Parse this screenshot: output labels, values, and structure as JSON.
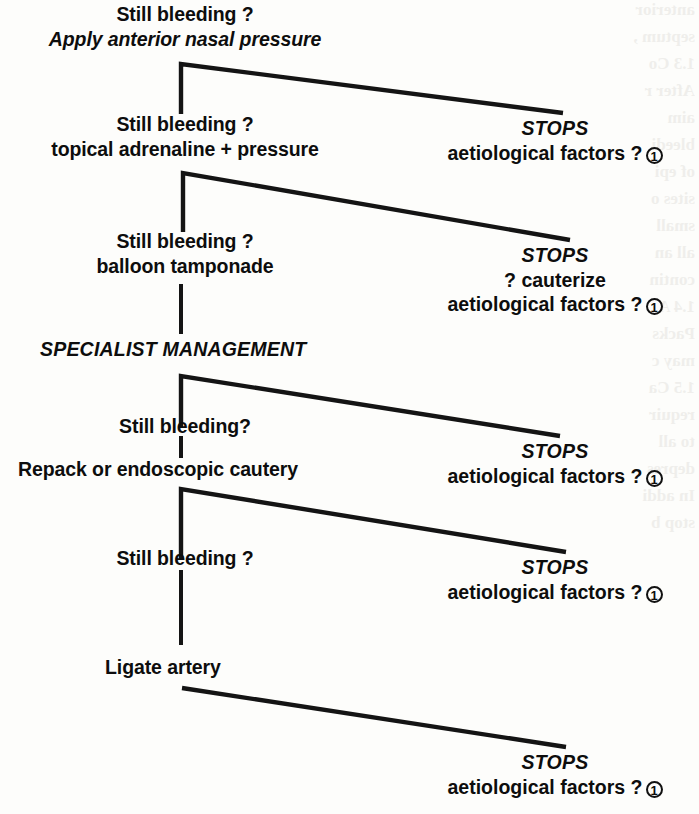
{
  "figure": {
    "type": "clinical-management-flowchart",
    "orientation": "vertical-cascade",
    "ink_color": "#141414",
    "page_color": "#fdfdfb"
  },
  "steps": [
    {
      "id": "step-1",
      "line1": "Still bleeding ?",
      "line2": "Apply anterior nasal pressure",
      "line2_style": "italic"
    },
    {
      "id": "step-2",
      "line1": "Still bleeding ?",
      "line2": "topical adrenaline + pressure",
      "line2_style": "normal"
    },
    {
      "id": "step-3",
      "line1": "Still bleeding  ?",
      "line2": "balloon tamponade",
      "line2_style": "normal"
    },
    {
      "id": "step-4",
      "line1": "Still bleeding?",
      "line2": "Repack or endoscopic cautery",
      "line2_style": "normal"
    },
    {
      "id": "step-5",
      "line1": "Still bleeding ?",
      "line2": "",
      "line2_style": "normal"
    },
    {
      "id": "step-6",
      "line1": "Ligate artery",
      "line2": "",
      "line2_style": "normal"
    }
  ],
  "phase_heading": {
    "id": "specialist-management",
    "label": "SPECIALIST MANAGEMENT"
  },
  "outcomes": [
    {
      "id": "outcome-1",
      "stops": "STOPS",
      "lines": [
        "aetiological factors ?"
      ],
      "note_marker": "1"
    },
    {
      "id": "outcome-2",
      "stops": "STOPS",
      "lines": [
        "? cauterize",
        "aetiological factors ?"
      ],
      "note_marker": "1"
    },
    {
      "id": "outcome-3",
      "stops": "STOPS",
      "lines": [
        "aetiological factors ?"
      ],
      "note_marker": "1"
    },
    {
      "id": "outcome-4",
      "stops": "STOPS",
      "lines": [
        "aetiological factors ?"
      ],
      "note_marker": "1"
    },
    {
      "id": "outcome-5",
      "stops": "STOPS",
      "lines": [
        "aetiological factors ?"
      ],
      "note_marker": "1"
    }
  ],
  "ghost_text": {
    "description": "faint show-through text from the facing page along the right margin",
    "lines": [
      "anterior",
      "septum ,",
      "",
      "1.3 Co",
      "After r",
      "aim",
      "bleedi",
      "of epi",
      "sites o",
      "small",
      "all an",
      "contin",
      "",
      "1.4 A",
      "Packs",
      "may c",
      "",
      "1.5 Ca",
      "requir",
      "to all",
      "depres",
      "In addi",
      "stop b"
    ]
  }
}
